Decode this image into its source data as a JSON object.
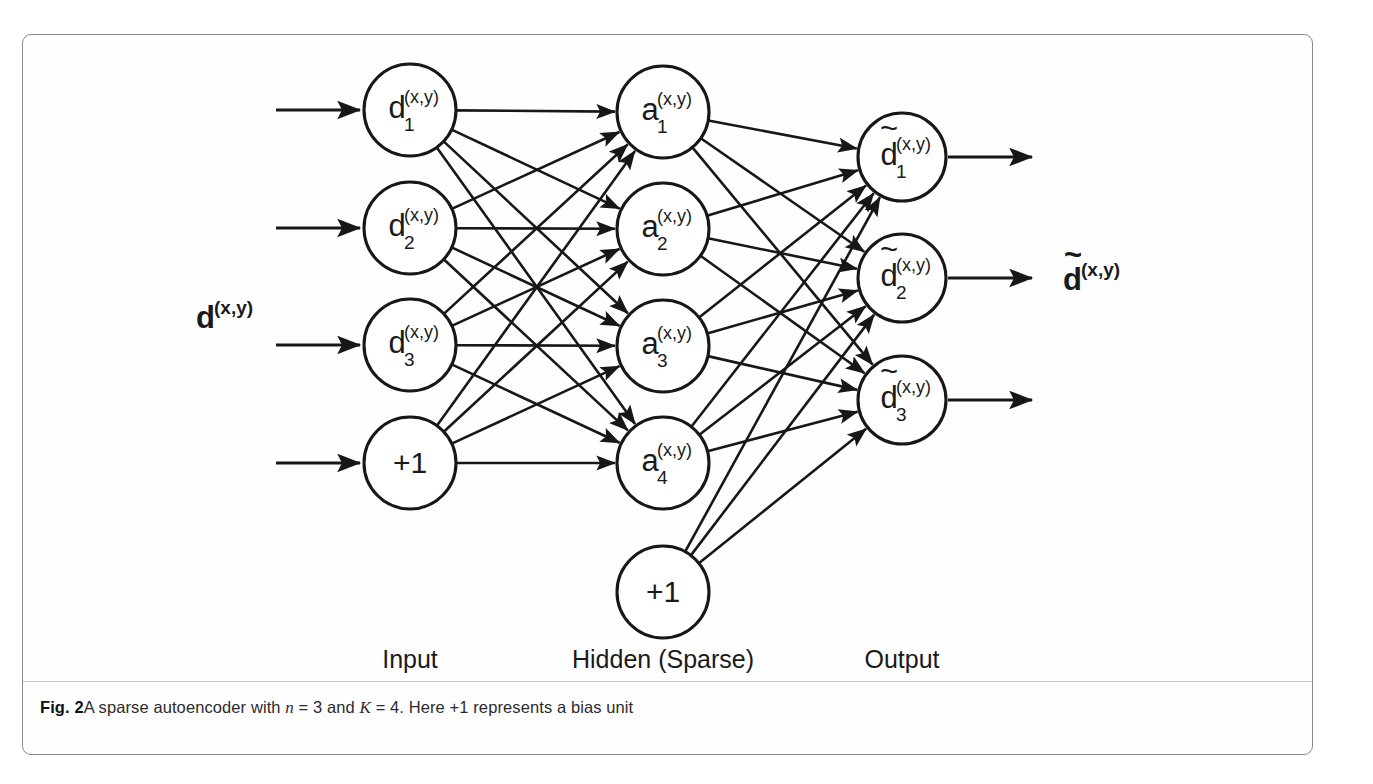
{
  "figure": {
    "caption_label": "Fig. 2",
    "caption_parts": {
      "text_1": "A sparse autoencoder with ",
      "math_n": "n",
      "text_2": " = 3 and ",
      "math_K": "K",
      "text_3": " = 4. Here +1 represents a bias unit"
    },
    "caption_full": "Fig. 2 A sparse autoencoder with n = 3 and K = 4. Here +1 represents a bias unit",
    "border_color": "#8a8a8a",
    "ink_color": "#171717"
  },
  "diagram": {
    "type": "neural-network",
    "layer_labels": [
      {
        "text": "Input",
        "x": 410,
        "y": 668
      },
      {
        "text": "Hidden (Sparse)",
        "x": 663,
        "y": 668
      },
      {
        "text": "Output",
        "x": 902,
        "y": 668
      }
    ],
    "side_labels": {
      "input": {
        "base": "d",
        "sup": "(x,y)",
        "tilde": false,
        "x": 196,
        "y": 328
      },
      "output": {
        "base": "d",
        "sup": "(x,y)",
        "tilde": true,
        "x": 1063,
        "y": 290
      }
    },
    "layers": [
      {
        "name": "input",
        "cx": 410,
        "radius": 46,
        "nodes": [
          {
            "id": "d1",
            "base": "d",
            "sub": "1",
            "sup": "(x,y)",
            "tilde": false,
            "cy": 110,
            "bias": false
          },
          {
            "id": "d2",
            "base": "d",
            "sub": "2",
            "sup": "(x,y)",
            "tilde": false,
            "cy": 228,
            "bias": false
          },
          {
            "id": "d3",
            "base": "d",
            "sub": "3",
            "sup": "(x,y)",
            "tilde": false,
            "cy": 345,
            "bias": false
          },
          {
            "id": "in_bias",
            "base": "+1",
            "sub": "",
            "sup": "",
            "tilde": false,
            "cy": 463,
            "bias": true
          }
        ]
      },
      {
        "name": "hidden",
        "cx": 663,
        "radius": 46,
        "nodes": [
          {
            "id": "a1",
            "base": "a",
            "sub": "1",
            "sup": "(x,y)",
            "tilde": false,
            "cy": 112,
            "bias": false
          },
          {
            "id": "a2",
            "base": "a",
            "sub": "2",
            "sup": "(x,y)",
            "tilde": false,
            "cy": 229,
            "bias": false
          },
          {
            "id": "a3",
            "base": "a",
            "sub": "3",
            "sup": "(x,y)",
            "tilde": false,
            "cy": 346,
            "bias": false
          },
          {
            "id": "a4",
            "base": "a",
            "sub": "4",
            "sup": "(x,y)",
            "tilde": false,
            "cy": 463,
            "bias": false
          },
          {
            "id": "hid_bias",
            "base": "+1",
            "sub": "",
            "sup": "",
            "tilde": false,
            "cy": 592,
            "bias": true
          }
        ]
      },
      {
        "name": "output",
        "cx": 902,
        "radius": 44,
        "nodes": [
          {
            "id": "o1",
            "base": "d",
            "sub": "1",
            "sup": "(x,y)",
            "tilde": true,
            "cy": 157,
            "bias": false
          },
          {
            "id": "o2",
            "base": "d",
            "sub": "2",
            "sup": "(x,y)",
            "tilde": true,
            "cy": 278,
            "bias": false
          },
          {
            "id": "o3",
            "base": "d",
            "sub": "3",
            "sup": "(x,y)",
            "tilde": true,
            "cy": 400,
            "bias": false
          }
        ]
      }
    ],
    "input_arrows": [
      {
        "x1": 276,
        "y1": 110,
        "x2": 360,
        "y2": 110
      },
      {
        "x1": 276,
        "y1": 228,
        "x2": 360,
        "y2": 228
      },
      {
        "x1": 276,
        "y1": 345,
        "x2": 360,
        "y2": 345
      },
      {
        "x1": 276,
        "y1": 463,
        "x2": 360,
        "y2": 463
      }
    ],
    "output_arrows": [
      {
        "x1": 948,
        "y1": 157,
        "x2": 1032,
        "y2": 157
      },
      {
        "x1": 948,
        "y1": 278,
        "x2": 1032,
        "y2": 278
      },
      {
        "x1": 948,
        "y1": 400,
        "x2": 1032,
        "y2": 400
      }
    ],
    "connections": {
      "input_to_hidden": "fully-connected (4 source nodes incl. bias to 4 hidden nodes)",
      "hidden_to_output": "fully-connected (5 source nodes incl. bias to 3 output nodes)"
    }
  }
}
